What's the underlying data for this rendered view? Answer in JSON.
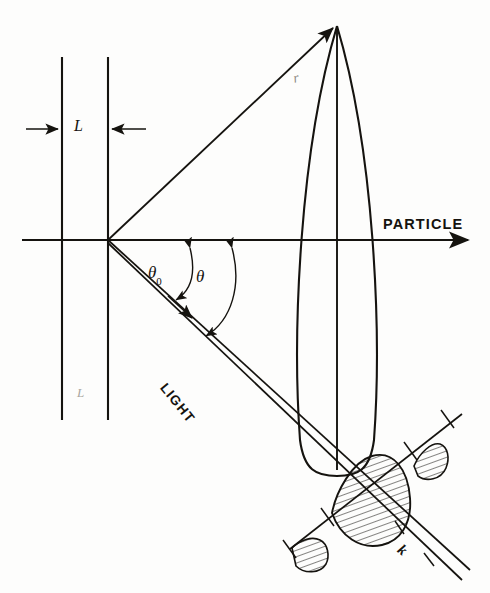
{
  "figure": {
    "kind": "optical-scattering-diagram",
    "background_color": "#fdfdfc",
    "ink_color": "#15130f",
    "faint_ink_color": "#8d8a84",
    "width": 490,
    "height": 593
  },
  "labels": {
    "particle": "PARTICLE",
    "light": "LIGHT",
    "slit_width": "L",
    "slit_width_faint": "L",
    "radius": "r",
    "wavevector": "k",
    "theta_zero_symbol": "θ",
    "theta_zero_subscript": "0",
    "theta_symbol": "θ"
  },
  "geometry": {
    "origin": {
      "x": 108,
      "y": 240
    },
    "slit_line_left_x": 62,
    "slit_line_right_x": 108,
    "slit_line_top_y": 57,
    "slit_line_bottom_y": 420,
    "axis_y": 240,
    "axis_start_x": 22,
    "axis_end_x": 478,
    "upper_ray_end": {
      "x": 337,
      "y": 26
    },
    "light_ray_end": {
      "x": 470,
      "y": 578
    },
    "lens_apex_top": {
      "x": 337,
      "y": 26
    },
    "lens_bottom_y": 468,
    "lens_half_width": 28,
    "pattern_axis_angle_deg": -38,
    "pattern_center": {
      "x": 375,
      "y": 490
    }
  },
  "annotations": {
    "dimension_arrow_label": "L",
    "angle_from_axis_outer": "θ0",
    "angle_from_axis_inner": "θ",
    "diffraction_lobes": [
      "side-lobe-lower-left",
      "main-lobe",
      "side-lobe-upper-right"
    ]
  }
}
